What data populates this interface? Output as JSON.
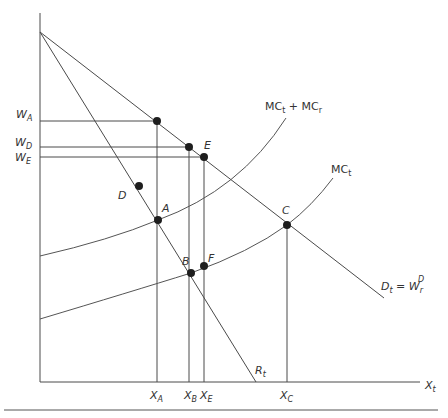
{
  "diagram": {
    "type": "economics-supply-demand",
    "axes": {
      "x_label_main": "X",
      "x_label_sub": "t"
    },
    "y_labels": [
      {
        "main": "W",
        "sub": "A"
      },
      {
        "main": "W",
        "sub": "D"
      },
      {
        "main": "W",
        "sub": "E"
      }
    ],
    "x_labels": [
      {
        "main": "X",
        "sub": "A"
      },
      {
        "main": "X",
        "sub": "B"
      },
      {
        "main": "X",
        "sub": "E"
      },
      {
        "main": "X",
        "sub": "C"
      }
    ],
    "curves": {
      "mc_sum": {
        "a": "MC",
        "a_sub": "t",
        "plus": " + ",
        "b": "MC",
        "b_sub": "r"
      },
      "mc_t": {
        "main": "MC",
        "sub": "t"
      },
      "demand": {
        "main": "D",
        "sub": "t",
        "eq": " = ",
        "w": "W",
        "w_sub": "r",
        "w_sup": "D"
      },
      "r_t": {
        "main": "R",
        "sub": "t"
      }
    },
    "points": {
      "A": "A",
      "B": "B",
      "C": "C",
      "D": "D",
      "E": "E",
      "F": "F"
    },
    "colors": {
      "line": "#4a4a4a",
      "dot": "#1e1e1e",
      "text": "#333333"
    }
  }
}
